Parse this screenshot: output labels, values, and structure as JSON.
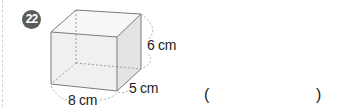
{
  "problem": {
    "number": "22",
    "figure": {
      "shape": "rectangular-prism",
      "dimensions": {
        "length": "8 cm",
        "width": "5 cm",
        "height": "6 cm"
      }
    },
    "answer": {
      "open_paren": "(",
      "close_paren": ")",
      "value": ""
    }
  }
}
